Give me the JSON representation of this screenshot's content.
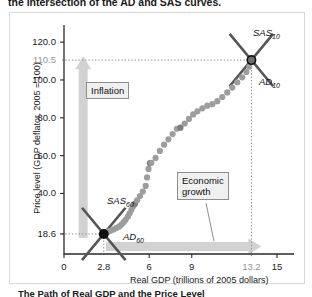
{
  "figure": {
    "top_heading": "the intersection of the AD and SAS curves.",
    "bottom_caption": "The Path of Real GDP and the Price Level"
  },
  "chart_data": {
    "type": "scatter",
    "title": "",
    "xlabel": "Real GDP (trillions of 2005 dollars)",
    "ylabel": "Price level (GDP deflator, 2005 = 100)",
    "xlim": [
      0,
      16.2
    ],
    "ylim": [
      8,
      128
    ],
    "grid": false,
    "legend": "none",
    "xticks": [
      "0",
      "2.8",
      "6",
      "9",
      "13.2",
      "15"
    ],
    "xtick_values": [
      0,
      2.8,
      6,
      9,
      13.2,
      15
    ],
    "xtick_muted": [
      false,
      false,
      false,
      false,
      true,
      false
    ],
    "yticks": [
      "120.0",
      "110.5",
      "100.0",
      "80.0",
      "60.0",
      "40.0",
      "18.6"
    ],
    "ytick_values": [
      120.0,
      110.5,
      100.0,
      80.0,
      60.0,
      40.0,
      18.6
    ],
    "ytick_muted": [
      false,
      true,
      false,
      false,
      false,
      false,
      false
    ],
    "points": [
      [
        2.8,
        18.6
      ],
      [
        2.95,
        19.2
      ],
      [
        3.1,
        19.8
      ],
      [
        3.3,
        20.4
      ],
      [
        3.5,
        21.0
      ],
      [
        3.7,
        21.8
      ],
      [
        3.9,
        22.6
      ],
      [
        4.05,
        23.6
      ],
      [
        4.2,
        24.8
      ],
      [
        4.35,
        26.2
      ],
      [
        4.5,
        27.8
      ],
      [
        4.62,
        29.5
      ],
      [
        4.75,
        31.4
      ],
      [
        4.88,
        33.2
      ],
      [
        5.0,
        34.6
      ],
      [
        5.15,
        36.4
      ],
      [
        5.35,
        38.6
      ],
      [
        5.55,
        41.0
      ],
      [
        5.75,
        44.0
      ],
      [
        5.85,
        48.5
      ],
      [
        5.95,
        53.0
      ],
      [
        6.05,
        56.0
      ],
      [
        6.15,
        56.2
      ],
      [
        6.45,
        58.8
      ],
      [
        6.75,
        62.5
      ],
      [
        7.05,
        65.8
      ],
      [
        7.35,
        68.6
      ],
      [
        7.65,
        71.4
      ],
      [
        7.95,
        74.2
      ],
      [
        8.2,
        74.8
      ],
      [
        8.5,
        77.0
      ],
      [
        8.8,
        79.4
      ],
      [
        9.1,
        81.8
      ],
      [
        9.4,
        83.4
      ],
      [
        9.75,
        85.0
      ],
      [
        10.1,
        86.4
      ],
      [
        10.45,
        87.2
      ],
      [
        10.8,
        88.8
      ],
      [
        11.15,
        91.0
      ],
      [
        11.5,
        93.4
      ],
      [
        11.85,
        96.0
      ],
      [
        12.2,
        98.8
      ],
      [
        12.55,
        101.4
      ],
      [
        12.85,
        104.2
      ],
      [
        13.05,
        107.0
      ],
      [
        13.2,
        110.5
      ]
    ],
    "dark_points": [
      [
        5.0,
        34.6
      ],
      [
        8.2,
        74.8
      ],
      [
        6.05,
        56.0
      ]
    ],
    "equilibria": [
      {
        "name": "1960",
        "x": 2.8,
        "y": 18.6,
        "marker": "filled"
      },
      {
        "name": "2010",
        "x": 13.2,
        "y": 110.5,
        "marker": "ring"
      }
    ],
    "curves": [
      {
        "label": "SAS",
        "subscript": "60",
        "kind": "sas",
        "x": 2.8,
        "y": 18.6
      },
      {
        "label": "AD",
        "subscript": "60",
        "kind": "ad",
        "x": 2.8,
        "y": 18.6
      },
      {
        "label": "SAS",
        "subscript": "10",
        "kind": "sas",
        "x": 13.2,
        "y": 110.5
      },
      {
        "label": "AD",
        "subscript": "10",
        "kind": "ad",
        "x": 13.2,
        "y": 110.5
      }
    ],
    "annotations": [
      {
        "id": "inflation",
        "text": "Inflation",
        "arrow": "vertical-up"
      },
      {
        "id": "economic-growth",
        "text": "Economic\ngrowth",
        "arrow": "horizontal-right"
      }
    ]
  },
  "labels": {
    "sas60": "SAS",
    "sas60_sub": "60",
    "ad60": "AD",
    "ad60_sub": "60",
    "sas10": "SAS",
    "sas10_sub": "10",
    "ad10": "AD",
    "ad10_sub": "10",
    "inflation": "Inflation",
    "growth_line1": "Economic",
    "growth_line2": "growth"
  },
  "colors": {
    "dot": "#9d9d9d",
    "dot_dark": "#7d7d7d",
    "curve": "#555555",
    "arrow_band": "#d2d2d2",
    "axis": "#2a2a2a",
    "dotted_guide": "#8d8d8d",
    "callout_bg": "#f0f0f0"
  }
}
